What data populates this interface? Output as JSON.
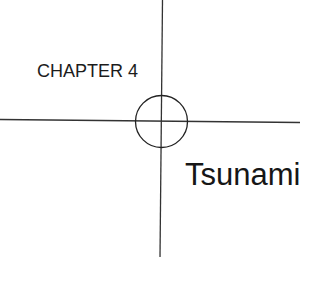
{
  "page": {
    "chapter_label": "CHAPTER 4",
    "chapter_title": "Tsunami",
    "graphic": {
      "type": "crosshair-target",
      "icon": "crosshair-circle-icon",
      "line_color": "#333333",
      "circle_color": "#222222"
    }
  }
}
